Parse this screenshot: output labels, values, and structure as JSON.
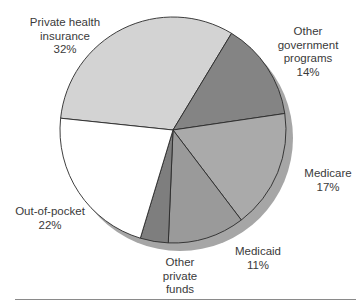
{
  "chart_data": {
    "type": "pie",
    "title": "",
    "start_angle_deg": 186,
    "direction": "clockwise",
    "center": [
      173,
      130
    ],
    "radius": 113,
    "shadow": {
      "offset": [
        7,
        8
      ],
      "color": "#a6a6a6"
    },
    "slices": [
      {
        "name": "Private health insurance",
        "value": 32,
        "label_lines": [
          "Private health",
          "insurance",
          "32%"
        ],
        "color": "#d3d3d3"
      },
      {
        "name": "Other government programs",
        "value": 14,
        "label_lines": [
          "Other",
          "government",
          "programs",
          "14%"
        ],
        "color": "#848484"
      },
      {
        "name": "Medicare",
        "value": 17,
        "label_lines": [
          "Medicare",
          "17%"
        ],
        "color": "#aaaaaa"
      },
      {
        "name": "Medicaid",
        "value": 11,
        "label_lines": [
          "Medicaid",
          "11%"
        ],
        "color": "#9a9a9a"
      },
      {
        "name": "Other private funds",
        "value": 4,
        "label_lines": [
          "Other",
          "private",
          "funds"
        ],
        "color": "#7e7e7e"
      },
      {
        "name": "Out-of-pocket",
        "value": 22,
        "label_lines": [
          "Out-of-pocket",
          "22%"
        ],
        "color": "#ffffff"
      }
    ]
  },
  "labels": {
    "private_health": {
      "line1": "Private health",
      "line2": "insurance",
      "pct": "32%"
    },
    "other_government": {
      "line1": "Other",
      "line2": "government",
      "line3": "programs",
      "pct": "14%"
    },
    "medicare": {
      "line1": "Medicare",
      "pct": "17%"
    },
    "medicaid": {
      "line1": "Medicaid",
      "pct": "11%"
    },
    "other_private": {
      "line1": "Other",
      "line2": "private",
      "line3": "funds"
    },
    "out_of_pocket": {
      "line1": "Out-of-pocket",
      "pct": "22%"
    }
  }
}
